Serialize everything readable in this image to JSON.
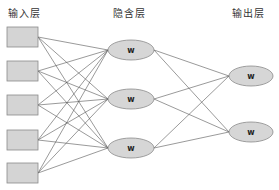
{
  "labels": {
    "input_layer": "输入层",
    "hidden_layer": "隐含层",
    "output_layer": "输出层"
  },
  "nodes": {
    "hidden": [
      "w",
      "w",
      "w"
    ],
    "output": [
      "w",
      "w"
    ],
    "input_count": 5
  },
  "colors": {
    "node_fill": "#d6d6d6",
    "node_stroke": "#8a8a8a",
    "edge": "#555555"
  }
}
